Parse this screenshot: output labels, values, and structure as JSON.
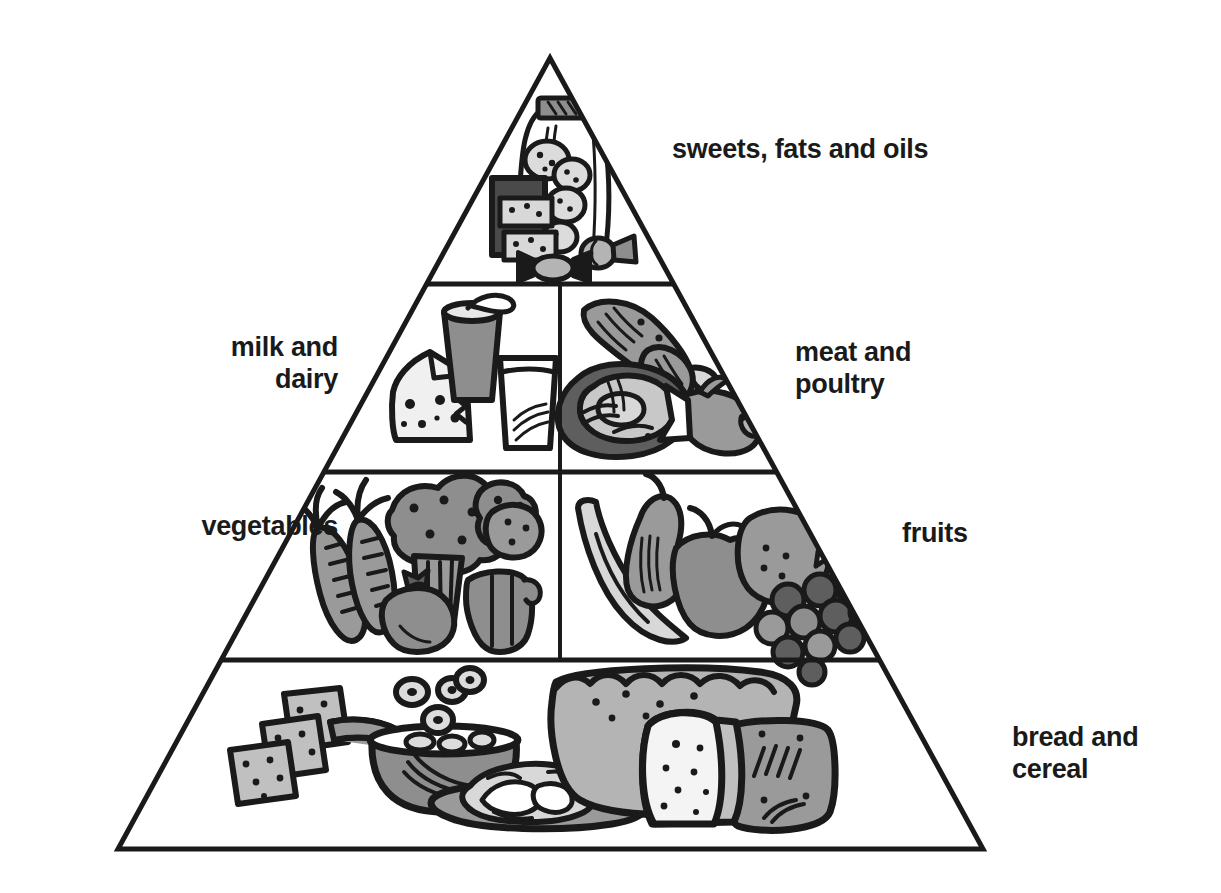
{
  "figure": {
    "shape": "triangle",
    "stroke_color": "#1a1a1a",
    "text_color": "#1a1a1a",
    "background_color": "#ffffff",
    "fill_light": "#d8d8d8",
    "fill_mid": "#9a9a9a",
    "fill_dark": "#5e5e5e"
  },
  "geometry": {
    "apex_x": 550,
    "apex_y": 58,
    "base_left_x": 118,
    "base_right_x": 983,
    "base_y": 849,
    "divider_y": [
      284,
      472,
      660
    ],
    "vertical_split_x": 560
  },
  "tiers": [
    {
      "id": "tier-sweets",
      "label": "sweets, fats and oils",
      "label_side": "right",
      "level": 1,
      "foods": [
        "cookie jar",
        "cookies",
        "cake slice",
        "wrapped candy"
      ]
    },
    {
      "id": "tier-milk",
      "label": "milk and\ndairy",
      "label_side": "left",
      "level": 2,
      "foods": [
        "cheese wedge",
        "yogurt cup with spoon",
        "glass of milk"
      ]
    },
    {
      "id": "tier-meat",
      "label": "meat and\npoultry",
      "label_side": "right",
      "level": 2,
      "foods": [
        "chicken drumsticks",
        "steak",
        "fish"
      ]
    },
    {
      "id": "tier-vegetables",
      "label": "vegetables",
      "label_side": "left",
      "level": 3,
      "foods": [
        "carrots",
        "broccoli",
        "tomato",
        "potato",
        "pepper"
      ]
    },
    {
      "id": "tier-fruits",
      "label": "fruits",
      "label_side": "right",
      "level": 3,
      "foods": [
        "banana",
        "pear",
        "apple",
        "orange",
        "grapes"
      ]
    },
    {
      "id": "tier-bread",
      "label": "bread and\ncereal",
      "label_side": "right",
      "level": 4,
      "foods": [
        "crackers",
        "bowl of cereal with spoon",
        "pasta on plate",
        "bread loaf",
        "bread slice"
      ]
    }
  ]
}
